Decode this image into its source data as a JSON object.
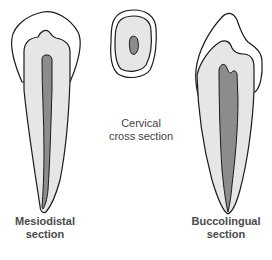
{
  "figure": {
    "colors": {
      "outline": "#1a1a1a",
      "enamel": "#ffffff",
      "dentin": "#e6e6e6",
      "pulp": "#8c8c8c"
    },
    "sections": [
      {
        "id": "mesiodistal",
        "label_line1": "Mesiodistal",
        "label_line2": "section"
      },
      {
        "id": "cervical",
        "label_line1": "Cervical",
        "label_line2": "cross section"
      },
      {
        "id": "buccolingual",
        "label_line1": "Buccolingual",
        "label_line2": "section"
      }
    ]
  }
}
